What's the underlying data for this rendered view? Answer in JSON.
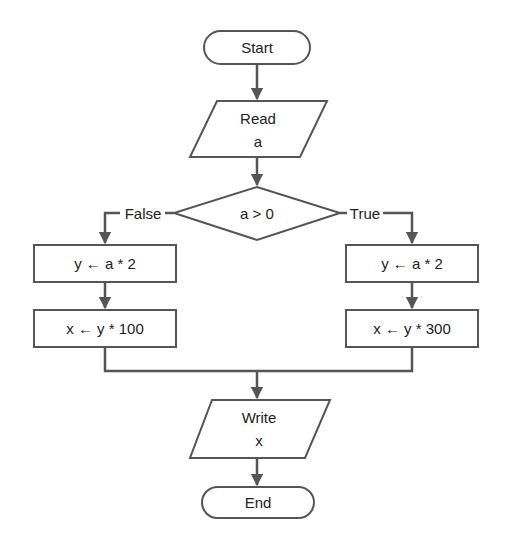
{
  "diagram": {
    "type": "flowchart",
    "colors": {
      "stroke": "#555555",
      "text": "#222222",
      "background": "#ffffff"
    },
    "nodes": {
      "start": {
        "shape": "terminator",
        "label": "Start"
      },
      "read": {
        "shape": "parallelogram",
        "line1": "Read",
        "line2": "a"
      },
      "decision": {
        "shape": "diamond",
        "label": "a > 0"
      },
      "false_step1": {
        "shape": "process",
        "label": "y ← a * 2"
      },
      "false_step2": {
        "shape": "process",
        "label": "x ← y * 100"
      },
      "true_step1": {
        "shape": "process",
        "label": "y ← a * 2"
      },
      "true_step2": {
        "shape": "process",
        "label": "x ← y * 300"
      },
      "write": {
        "shape": "parallelogram",
        "line1": "Write",
        "line2": "x"
      },
      "end": {
        "shape": "terminator",
        "label": "End"
      }
    },
    "edges": {
      "false_label": "False",
      "true_label": "True"
    }
  }
}
